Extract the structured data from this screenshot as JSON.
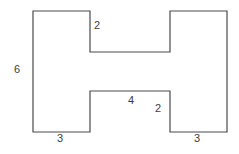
{
  "figure": {
    "name": "h-shaped-polygon-with-side-lengths",
    "stroke_color": "#4a4a4a",
    "fill_color": "#ffffff",
    "background_color": "#ffffff",
    "text_color": "#3d3d3d",
    "stroke_width": 1.2
  },
  "shape": {
    "type": "polygon",
    "points": "33,11 90,11 90,52 170,52 170,11 227,11 227,132 170,132 170,91 90,91 90,132 33,132"
  },
  "labels": [
    {
      "id": "label-top-notch-2",
      "text": "2",
      "x": 94,
      "y": 20
    },
    {
      "id": "label-left-height-6",
      "text": "6",
      "x": 14,
      "y": 64
    },
    {
      "id": "label-middle-bar-4",
      "text": "4",
      "x": 128,
      "y": 95
    },
    {
      "id": "label-right-notch-2",
      "text": "2",
      "x": 155,
      "y": 103
    },
    {
      "id": "label-bottom-left-3",
      "text": "3",
      "x": 57,
      "y": 133
    },
    {
      "id": "label-bottom-right-3",
      "text": "3",
      "x": 194,
      "y": 133
    }
  ]
}
